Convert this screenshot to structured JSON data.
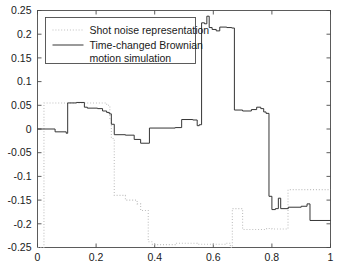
{
  "chart_data": {
    "type": "line",
    "title": "",
    "xlabel": "",
    "ylabel": "",
    "xlim": [
      0,
      1
    ],
    "ylim": [
      -0.25,
      0.25
    ],
    "grid": false,
    "legend_position": "top-left",
    "xticks": [
      0,
      0.2,
      0.4,
      0.6,
      0.8,
      1
    ],
    "xtick_labels": [
      "0",
      "0.2",
      "0.4",
      "0.6",
      "0.8",
      "1"
    ],
    "yticks": [
      -0.25,
      -0.2,
      -0.15,
      -0.1,
      -0.05,
      0,
      0.05,
      0.1,
      0.15,
      0.2,
      0.25
    ],
    "ytick_labels": [
      "-0.25",
      "-0.2",
      "-0.15",
      "-0.1",
      "-0.05",
      "0",
      "0.05",
      "0.1",
      "0.15",
      "0.2",
      "0.25"
    ],
    "series": [
      {
        "name": "Shot noise representation",
        "style": "dotted",
        "color": "#bfbfbf",
        "interpolation": "step",
        "x": [
          0.0,
          0.022,
          0.022,
          0.236,
          0.236,
          0.247,
          0.247,
          0.252,
          0.252,
          0.262,
          0.262,
          0.3,
          0.3,
          0.34,
          0.34,
          0.352,
          0.352,
          0.378,
          0.378,
          0.392,
          0.392,
          0.47,
          0.47,
          0.545,
          0.545,
          0.64,
          0.64,
          0.658,
          0.658,
          0.665,
          0.665,
          0.7,
          0.7,
          0.718,
          0.718,
          0.782,
          0.782,
          0.8,
          0.8,
          0.855,
          0.855,
          1.0
        ],
        "y": [
          -0.25,
          -0.25,
          0.055,
          0.055,
          0.05,
          0.05,
          0.022,
          0.022,
          -0.02,
          -0.02,
          -0.14,
          -0.14,
          -0.15,
          -0.15,
          -0.158,
          -0.158,
          -0.172,
          -0.172,
          -0.238,
          -0.238,
          -0.244,
          -0.244,
          -0.241,
          -0.241,
          -0.243,
          -0.243,
          -0.241,
          -0.241,
          -0.25,
          -0.25,
          -0.168,
          -0.168,
          -0.212,
          -0.212,
          -0.212,
          -0.212,
          -0.21,
          -0.21,
          -0.211,
          -0.211,
          -0.128,
          -0.128
        ]
      },
      {
        "name": "Time-changed Brownian motion simulation",
        "style": "solid",
        "color": "#2b2b2b",
        "interpolation": "step",
        "x": [
          0.0,
          0.06,
          0.06,
          0.098,
          0.098,
          0.103,
          0.103,
          0.133,
          0.133,
          0.16,
          0.16,
          0.17,
          0.17,
          0.205,
          0.205,
          0.222,
          0.222,
          0.236,
          0.236,
          0.245,
          0.245,
          0.252,
          0.252,
          0.262,
          0.262,
          0.3,
          0.3,
          0.33,
          0.33,
          0.352,
          0.352,
          0.382,
          0.382,
          0.47,
          0.47,
          0.492,
          0.492,
          0.53,
          0.53,
          0.545,
          0.545,
          0.552,
          0.552,
          0.56,
          0.56,
          0.57,
          0.57,
          0.578,
          0.578,
          0.586,
          0.586,
          0.596,
          0.596,
          0.61,
          0.61,
          0.622,
          0.622,
          0.646,
          0.646,
          0.663,
          0.663,
          0.672,
          0.672,
          0.7,
          0.7,
          0.73,
          0.73,
          0.748,
          0.748,
          0.762,
          0.762,
          0.772,
          0.772,
          0.78,
          0.78,
          0.79,
          0.79,
          0.8,
          0.8,
          0.812,
          0.812,
          0.822,
          0.822,
          0.83,
          0.83,
          0.856,
          0.856,
          0.9,
          0.9,
          0.92,
          0.92,
          0.93,
          0.93,
          1.0
        ],
        "y": [
          0.0,
          0.0,
          -0.006,
          -0.006,
          -0.009,
          -0.009,
          0.055,
          0.055,
          0.056,
          0.056,
          0.046,
          0.046,
          0.044,
          0.044,
          0.043,
          0.043,
          0.038,
          0.038,
          0.035,
          0.035,
          0.032,
          0.032,
          0.01,
          0.01,
          -0.012,
          -0.012,
          -0.013,
          -0.013,
          -0.022,
          -0.022,
          -0.03,
          -0.03,
          0.002,
          0.002,
          0.003,
          0.003,
          0.02,
          0.02,
          0.019,
          0.019,
          0.007,
          0.007,
          0.009,
          0.009,
          0.224,
          0.224,
          0.222,
          0.222,
          0.238,
          0.238,
          0.214,
          0.214,
          0.21,
          0.21,
          0.207,
          0.207,
          0.215,
          0.215,
          0.214,
          0.214,
          0.213,
          0.213,
          0.04,
          0.04,
          0.038,
          0.038,
          0.041,
          0.041,
          0.046,
          0.046,
          0.043,
          0.043,
          0.036,
          0.036,
          0.033,
          0.033,
          -0.142,
          -0.142,
          -0.17,
          -0.17,
          -0.168,
          -0.168,
          -0.146,
          -0.146,
          -0.168,
          -0.168,
          -0.165,
          -0.165,
          -0.163,
          -0.163,
          -0.158,
          -0.158,
          -0.193,
          -0.193
        ]
      }
    ]
  },
  "legend": {
    "entries": [
      {
        "label": "Shot noise representation"
      },
      {
        "label": "Time-changed Brownian"
      },
      {
        "label": "motion simulation"
      }
    ]
  }
}
